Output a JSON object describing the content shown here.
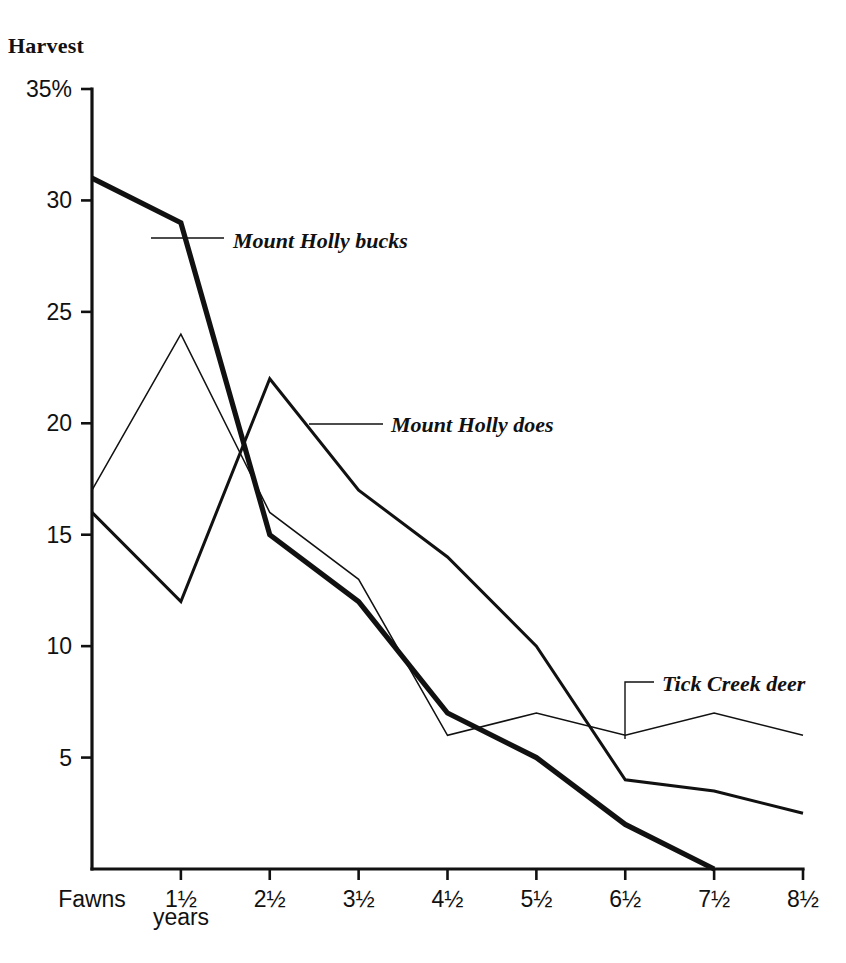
{
  "chart_data": {
    "type": "line",
    "title": "Harvest",
    "xlabel": "years",
    "ylabel": "Harvest",
    "ylim": [
      0,
      35
    ],
    "xlim": [
      0,
      8
    ],
    "grid": false,
    "legend": "inline-annotations",
    "y_unit": "%",
    "categories": [
      "Fawns",
      "1½",
      "2½",
      "3½",
      "4½",
      "5½",
      "6½",
      "7½",
      "8½"
    ],
    "y_ticks": [
      "35%",
      "30",
      "25",
      "20",
      "15",
      "10",
      "5"
    ],
    "y_tick_values": [
      35,
      30,
      25,
      20,
      15,
      10,
      5
    ],
    "series": [
      {
        "name": "Mount Holly bucks",
        "stroke_width": 5.2,
        "color": "#111111",
        "x": [
          "Fawns",
          "1½",
          "2½",
          "3½",
          "4½",
          "5½",
          "6½",
          "7½"
        ],
        "values": [
          31,
          29,
          15,
          12,
          7,
          5,
          2,
          0
        ]
      },
      {
        "name": "Mount Holly does",
        "stroke_width": 3.0,
        "color": "#111111",
        "x": [
          "Fawns",
          "1½",
          "2½",
          "3½",
          "4½",
          "5½",
          "6½",
          "7½",
          "8½"
        ],
        "values": [
          16,
          12,
          22,
          17,
          14,
          10,
          4,
          3.5,
          2.5
        ]
      },
      {
        "name": "Tick Creek deer",
        "stroke_width": 1.5,
        "color": "#111111",
        "x": [
          "Fawns",
          "1½",
          "2½",
          "3½",
          "4½",
          "5½",
          "6½",
          "7½",
          "8½"
        ],
        "values": [
          17,
          24,
          16,
          13,
          6,
          7,
          6,
          7,
          6
        ]
      }
    ],
    "annotations": [
      {
        "label": "Mount Holly bucks",
        "series": "Mount Holly bucks",
        "text_x": 233,
        "text_y": 248,
        "leader": "M 151,238 L 224,238"
      },
      {
        "label": "Mount Holly does",
        "series": "Mount Holly does",
        "text_x": 391,
        "text_y": 432,
        "leader": "M 309,424 L 383,424"
      },
      {
        "label": "Tick Creek deer",
        "series": "Tick Creek deer",
        "text_x": 662,
        "text_y": 691,
        "leader": "M 625,739 L 625,682 L 654,682"
      }
    ]
  }
}
